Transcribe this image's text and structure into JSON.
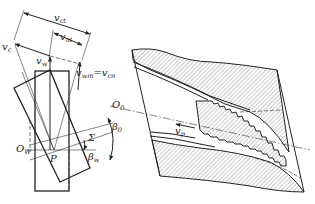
{
  "figure": {
    "left_diagram": {
      "labels": {
        "v_ct": "v",
        "v_ct_sub": "ct",
        "v_nt": "v",
        "v_nt_sub": "nt",
        "v_c": "v",
        "v_c_sub": "c",
        "v_w": "v",
        "v_w_sub": "w",
        "v_wm": "v",
        "v_wm_sub": "wm",
        "v_wm_eq": "=v",
        "v_cn_sub": "cn",
        "O_W": "O",
        "O_W_sub": "W",
        "P": "P",
        "Sigma": "Σ",
        "beta_w": "β",
        "beta_w_sub": "w",
        "O_0": "O",
        "O_0_sub": "0",
        "beta_0": "β",
        "beta_0_sub": "0"
      }
    },
    "right_diagram": {
      "labels": {
        "v_p": "v",
        "v_p_sub": "p"
      }
    },
    "colors": {
      "line": "#222222",
      "hatch": "#555555",
      "background": "#ffffff"
    }
  }
}
